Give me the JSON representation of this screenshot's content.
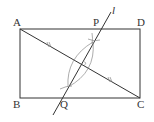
{
  "diagram": {
    "type": "geometry-construction",
    "colors": {
      "line": "#333333",
      "arc": "#888888",
      "background": "#ffffff"
    },
    "points": {
      "A": {
        "label": "A",
        "x": 20,
        "y": 29
      },
      "D": {
        "label": "D",
        "x": 140,
        "y": 29
      },
      "B": {
        "label": "B",
        "x": 20,
        "y": 98
      },
      "C": {
        "label": "C",
        "x": 140,
        "y": 98
      },
      "P": {
        "label": "P",
        "x": 95,
        "y": 29
      },
      "Q": {
        "label": "Q",
        "x": 66,
        "y": 98
      }
    },
    "line_l": {
      "label": "l"
    },
    "segments": [
      "AB",
      "BC",
      "CD",
      "DA",
      "AC"
    ],
    "marks": "equal-length tick marks on AC halves; construction arcs about midpoint of AC"
  }
}
